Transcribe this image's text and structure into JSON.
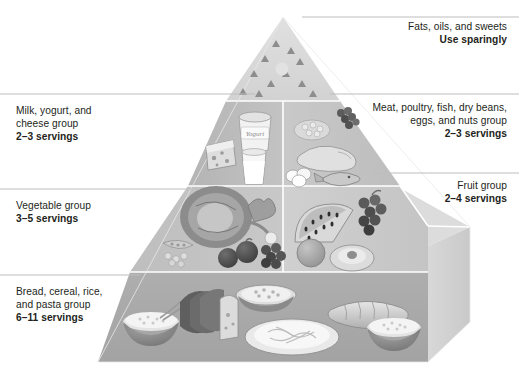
{
  "diagram": {
    "name": "Food Guide Pyramid",
    "shape": "pyramid",
    "tiers": 4,
    "colors": {
      "tier_fats": "#d8d8d8",
      "tier_milk": "#b9b9b9",
      "tier_meat": "#c6c6c6",
      "tier_vegetable": "#c2c2c2",
      "tier_fruit": "#cfcfcf",
      "tier_bread": "#a8a8a8",
      "side_face": "#d2d2d2",
      "leader_line": "#b5b5b5",
      "text": "#231f20",
      "background": "#ffffff"
    }
  },
  "callouts": {
    "fats": {
      "group": "Fats, oils, and sweets",
      "servings": "Use sparingly",
      "side": "right"
    },
    "meat": {
      "group_line1": "Meat, poultry, fish, dry beans,",
      "group_line2": "eggs, and nuts group",
      "servings": "2–3 servings",
      "side": "right"
    },
    "fruit": {
      "group": "Fruit group",
      "servings": "2–4 servings",
      "side": "right"
    },
    "milk": {
      "group_line1": "Milk, yogurt, and",
      "group_line2": "cheese group",
      "servings": "2–3 servings",
      "side": "left"
    },
    "vegetable": {
      "group": "Vegetable group",
      "servings": "3–5 servings",
      "side": "left"
    },
    "bread": {
      "group_line1": "Bread, cereal, rice,",
      "group_line2": "and pasta group",
      "servings": "6–11 servings",
      "side": "left"
    }
  },
  "illustrations": {
    "fats_tier": [
      "fat-triangle-symbol",
      "sugar-circle-symbol"
    ],
    "milk_tier": [
      "yogurt-container",
      "cheese-wedge",
      "milk-glass"
    ],
    "meat_tier": [
      "beans",
      "grapes-nuts",
      "poultry",
      "eggs",
      "fish"
    ],
    "vegetable_tier": [
      "cabbage",
      "broccoli",
      "carrot",
      "peas",
      "eggplant",
      "grapes-dark"
    ],
    "fruit_tier": [
      "watermelon-slice",
      "grapes",
      "orange",
      "peach-half"
    ],
    "bread_tier": [
      "rice-bowl",
      "sliced-bread",
      "cheese-block",
      "cereal-bowl",
      "pasta-plate",
      "bread-loaf",
      "grain-bowl"
    ]
  },
  "labels": {
    "yogurt_container_text": "Yogurt"
  }
}
